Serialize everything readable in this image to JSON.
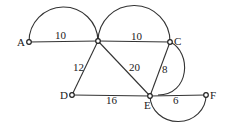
{
  "diagram": {
    "nodes": [
      {
        "id": "A",
        "label": "A",
        "x": 29,
        "y": 42
      },
      {
        "id": "B",
        "label": "",
        "x": 98,
        "y": 41
      },
      {
        "id": "C",
        "label": "C",
        "x": 170,
        "y": 42
      },
      {
        "id": "D",
        "label": "D",
        "x": 72,
        "y": 95
      },
      {
        "id": "E",
        "label": "E",
        "x": 150,
        "y": 96
      },
      {
        "id": "F",
        "label": "F",
        "x": 206,
        "y": 95
      }
    ],
    "edges": [
      {
        "from": "A",
        "to": "B",
        "weight": "10"
      },
      {
        "from": "B",
        "to": "C",
        "weight": "10"
      },
      {
        "from": "B",
        "to": "D",
        "weight": "12"
      },
      {
        "from": "B",
        "to": "E",
        "weight": "20"
      },
      {
        "from": "C",
        "to": "E",
        "weight": "8"
      },
      {
        "from": "D",
        "to": "E",
        "weight": "16"
      },
      {
        "from": "E",
        "to": "F",
        "weight": "6"
      }
    ],
    "arcs": [
      {
        "between": [
          "A",
          "B"
        ],
        "side": "above"
      },
      {
        "between": [
          "B",
          "C"
        ],
        "side": "above"
      },
      {
        "between": [
          "C",
          "E"
        ],
        "side": "right"
      },
      {
        "between": [
          "E",
          "F"
        ],
        "side": "below"
      }
    ]
  }
}
